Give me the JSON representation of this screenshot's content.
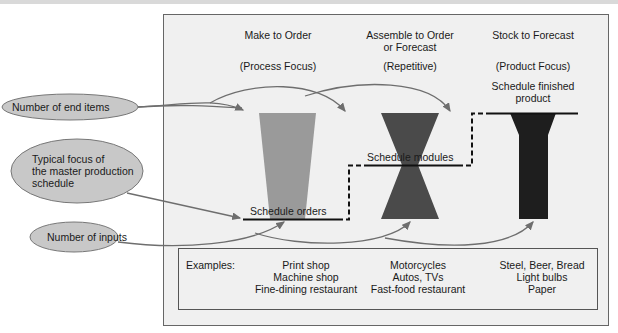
{
  "columns": [
    {
      "title_line1": "Make to Order",
      "title_line2": "",
      "subtitle": "(Process Focus)",
      "schedule_label": "Schedule orders",
      "shape": "trapezoid",
      "shape_color": "#9a9a9a",
      "examples": [
        "Print shop",
        "Machine shop",
        "Fine-dining restaurant"
      ]
    },
    {
      "title_line1": "Assemble to Order",
      "title_line2": "or Forecast",
      "subtitle": "(Repetitive)",
      "schedule_label": "Schedule modules",
      "shape": "hourglass",
      "shape_color": "#4a4a4a",
      "examples": [
        "Motorcycles",
        "Autos, TVs",
        "Fast-food restaurant"
      ]
    },
    {
      "title_line1": "Stock to Forecast",
      "title_line2": "",
      "subtitle": "(Product Focus)",
      "schedule_label_line1": "Schedule finished",
      "schedule_label_line2": "product",
      "shape": "y-funnel",
      "shape_color": "#1e1e1e",
      "examples": [
        "Steel, Beer, Bread",
        "Light bulbs",
        "Paper"
      ]
    }
  ],
  "callouts": {
    "end_items": "Number of end items",
    "focus_line1": "Typical focus of",
    "focus_line2": "the master production",
    "focus_line3": "schedule",
    "inputs": "Number of inputs"
  },
  "examples_label": "Examples:",
  "colors": {
    "panel_bg": "#f0f0f0",
    "ellipse_fill": "#c8c8c8",
    "arrow": "#6e6e6e",
    "border": "#555555"
  }
}
